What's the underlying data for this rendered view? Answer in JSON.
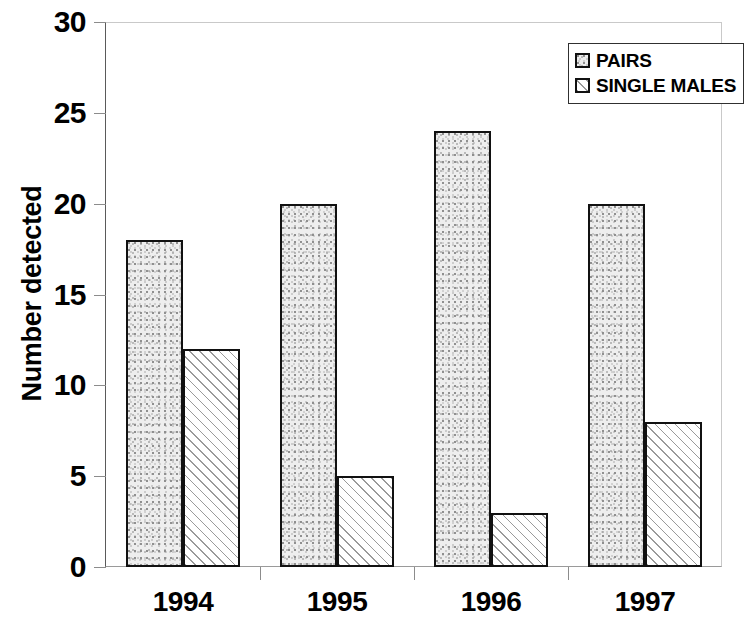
{
  "chart_data": {
    "type": "bar",
    "title": "",
    "xlabel": "",
    "ylabel": "Number detected",
    "categories": [
      "1994",
      "1995",
      "1996",
      "1997"
    ],
    "series": [
      {
        "name": "PAIRS",
        "values": [
          18,
          20,
          24,
          20
        ],
        "fill": "stipple-gray",
        "color": "#eeeeee"
      },
      {
        "name": "SINGLE MALES",
        "values": [
          12,
          5,
          3,
          8
        ],
        "fill": "diagonal-hatch",
        "color": "#ffffff"
      }
    ],
    "ylim": [
      0,
      30
    ],
    "ytick_values": [
      0,
      5,
      10,
      15,
      20,
      25,
      30
    ],
    "ytick_labels": [
      "0",
      "5",
      "10",
      "15",
      "20",
      "25",
      "30"
    ],
    "grid": false,
    "legend_position": "top-right",
    "axis_color": "#111111",
    "background": "#ffffff"
  },
  "legend": {
    "entries": [
      {
        "label": "PAIRS"
      },
      {
        "label": "SINGLE MALES"
      }
    ]
  },
  "axes": {
    "y_title": "Number detected"
  }
}
